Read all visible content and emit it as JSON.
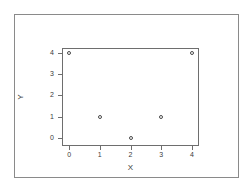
{
  "chart_data": {
    "type": "scatter",
    "title": "",
    "xlabel": "X",
    "ylabel": "Y",
    "xlim": [
      -0.2,
      4.2
    ],
    "ylim": [
      -0.35,
      4.2
    ],
    "xticks": [
      "0",
      "1",
      "2",
      "3",
      "4"
    ],
    "yticks": [
      "0",
      "1",
      "2",
      "3",
      "4"
    ],
    "xtick_values": [
      0,
      1,
      2,
      3,
      4
    ],
    "ytick_values": [
      0,
      1,
      2,
      3,
      4
    ],
    "grid": false,
    "legend": false,
    "marker": "open-circle",
    "marker_color": "#4a4a4a",
    "points": [
      {
        "x": 0,
        "y": 4
      },
      {
        "x": 1,
        "y": 1
      },
      {
        "x": 2,
        "y": 0
      },
      {
        "x": 3,
        "y": 1
      },
      {
        "x": 4,
        "y": 4
      }
    ],
    "x": [
      0,
      1,
      2,
      3,
      4
    ],
    "values": [
      4,
      1,
      0,
      1,
      4
    ]
  },
  "figure": {
    "background_color": "#ffffff",
    "frame_color": "#8a8a8a",
    "axis_color": "#6e6e6e",
    "text_color": "#3a3a3a"
  }
}
